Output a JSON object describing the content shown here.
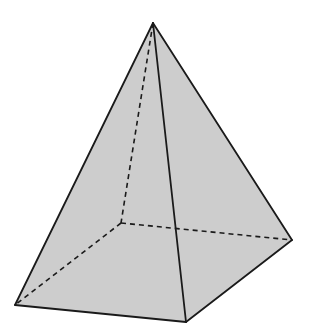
{
  "diagram": {
    "colors": {
      "background": "#ffffff",
      "face_fill": "#cdcdcd",
      "edge": "#1a1a1a"
    },
    "vertices": {
      "apex": [
        153,
        23
      ],
      "base_front_left": [
        15,
        305
      ],
      "base_front": [
        186,
        322
      ],
      "base_right": [
        292,
        240
      ],
      "base_back_hidden": [
        121,
        223
      ]
    },
    "visible_edges": [
      [
        "apex",
        "base_front_left"
      ],
      [
        "apex",
        "base_front"
      ],
      [
        "apex",
        "base_right"
      ],
      [
        "base_front_left",
        "base_front"
      ],
      [
        "base_front",
        "base_right"
      ]
    ],
    "hidden_edges": [
      [
        "apex",
        "base_back_hidden"
      ],
      [
        "base_back_hidden",
        "base_front_left"
      ],
      [
        "base_back_hidden",
        "base_right"
      ]
    ]
  }
}
